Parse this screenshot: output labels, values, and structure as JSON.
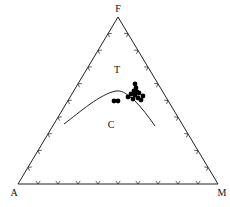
{
  "diagram": {
    "type": "ternary",
    "vertices": {
      "top": {
        "label": "F",
        "x": 118,
        "y": 17
      },
      "left": {
        "label": "A",
        "x": 18,
        "y": 184
      },
      "right": {
        "label": "M",
        "x": 218,
        "y": 184
      }
    },
    "regions": [
      {
        "label": "T",
        "x": 117,
        "y": 73
      },
      {
        "label": "C",
        "x": 111,
        "y": 128
      }
    ],
    "ticks_per_side": 9,
    "boundary_curve": "M64,124 C80,112 100,94 116,91 C124,90 128,96 134,100 C142,108 148,116 155,126",
    "points": [
      {
        "x": 114,
        "y": 101
      },
      {
        "x": 118,
        "y": 101
      },
      {
        "x": 135,
        "y": 84
      },
      {
        "x": 136,
        "y": 88
      },
      {
        "x": 134,
        "y": 91
      },
      {
        "x": 131,
        "y": 94
      },
      {
        "x": 135,
        "y": 95
      },
      {
        "x": 139,
        "y": 93
      },
      {
        "x": 128,
        "y": 97
      },
      {
        "x": 133,
        "y": 99
      },
      {
        "x": 138,
        "y": 98
      },
      {
        "x": 143,
        "y": 96
      },
      {
        "x": 141,
        "y": 100
      },
      {
        "x": 137,
        "y": 92
      }
    ],
    "colors": {
      "line": "#222222",
      "point": "#000000",
      "text": "#111111"
    }
  }
}
